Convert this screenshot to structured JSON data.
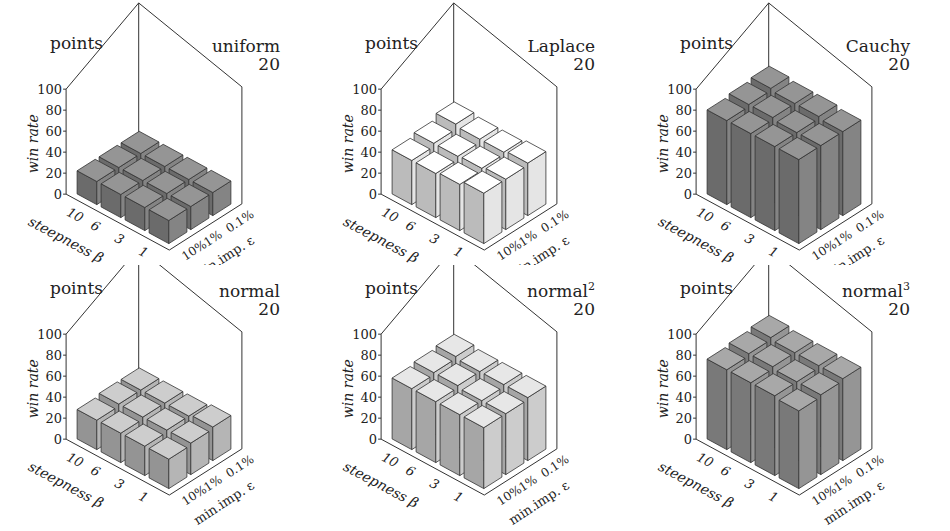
{
  "figure": {
    "grid": [
      2,
      3
    ],
    "common": {
      "corner_label": "points",
      "zlabel": "win rate",
      "xlabel": "steepness β",
      "ylabel": "min.imp. ε",
      "z_ticks": [
        "0",
        "20",
        "40",
        "60",
        "80",
        "100"
      ],
      "x_ticks": [
        "10",
        "6",
        "3",
        "1"
      ],
      "y_ticks": [
        "10%",
        "1%",
        "0.1%"
      ]
    }
  },
  "chart_data": [
    {
      "type": "bar3d",
      "title": "uniform",
      "title_sup": "",
      "subtitle": "20",
      "corner_label": "points",
      "xlabel": "steepness β",
      "ylabel": "min.imp. ε",
      "zlabel": "win rate",
      "x": [
        "10",
        "6",
        "3",
        "1"
      ],
      "y": [
        "10%",
        "1%",
        "0.1%"
      ],
      "zlim": [
        0,
        100
      ],
      "values": [
        [
          22,
          22,
          22
        ],
        [
          22,
          22,
          22
        ],
        [
          22,
          22,
          22
        ],
        [
          22,
          22,
          22
        ]
      ],
      "color": "#7a7a7a"
    },
    {
      "type": "bar3d",
      "title": "Laplace",
      "title_sup": "",
      "subtitle": "20",
      "corner_label": "points",
      "xlabel": "steepness β",
      "ylabel": "min.imp. ε",
      "zlabel": "win rate",
      "x": [
        "10",
        "6",
        "3",
        "1"
      ],
      "y": [
        "10%",
        "1%",
        "0.1%"
      ],
      "zlim": [
        0,
        100
      ],
      "values": [
        [
          42,
          45,
          50
        ],
        [
          42,
          45,
          48
        ],
        [
          44,
          46,
          48
        ],
        [
          48,
          48,
          50
        ]
      ],
      "color": "#d4d4d4"
    },
    {
      "type": "bar3d",
      "title": "Cauchy",
      "title_sup": "",
      "subtitle": "20",
      "corner_label": "points",
      "xlabel": "steepness β",
      "ylabel": "min.imp. ε",
      "zlabel": "win rate",
      "x": [
        "10",
        "6",
        "3",
        "1"
      ],
      "y": [
        "10%",
        "1%",
        "0.1%"
      ],
      "zlim": [
        0,
        100
      ],
      "values": [
        [
          80,
          82,
          84
        ],
        [
          80,
          82,
          82
        ],
        [
          80,
          80,
          82
        ],
        [
          80,
          80,
          80
        ]
      ],
      "color": "#7a7a7a"
    },
    {
      "type": "bar3d",
      "title": "normal",
      "title_sup": "",
      "subtitle": "20",
      "corner_label": "points",
      "xlabel": "steepness β",
      "ylabel": "min.imp. ε",
      "zlabel": "win rate",
      "x": [
        "10",
        "6",
        "3",
        "1"
      ],
      "y": [
        "10%",
        "1%",
        "0.1%"
      ],
      "zlim": [
        0,
        100
      ],
      "values": [
        [
          28,
          30,
          30
        ],
        [
          28,
          30,
          30
        ],
        [
          28,
          30,
          30
        ],
        [
          28,
          30,
          32
        ]
      ],
      "color": "#a8a8a8"
    },
    {
      "type": "bar3d",
      "title": "normal",
      "title_sup": "2",
      "subtitle": "20",
      "corner_label": "points",
      "xlabel": "steepness β",
      "ylabel": "min.imp. ε",
      "zlabel": "win rate",
      "x": [
        "10",
        "6",
        "3",
        "1"
      ],
      "y": [
        "10%",
        "1%",
        "0.1%"
      ],
      "zlim": [
        0,
        100
      ],
      "values": [
        [
          58,
          60,
          62
        ],
        [
          58,
          60,
          60
        ],
        [
          58,
          58,
          60
        ],
        [
          58,
          58,
          60
        ]
      ],
      "color": "#bdbdbd"
    },
    {
      "type": "bar3d",
      "title": "normal",
      "title_sup": "3",
      "subtitle": "20",
      "corner_label": "points",
      "xlabel": "steepness β",
      "ylabel": "min.imp. ε",
      "zlabel": "win rate",
      "x": [
        "10",
        "6",
        "3",
        "1"
      ],
      "y": [
        "10%",
        "1%",
        "0.1%"
      ],
      "zlim": [
        0,
        100
      ],
      "values": [
        [
          76,
          78,
          80
        ],
        [
          76,
          78,
          78
        ],
        [
          76,
          76,
          78
        ],
        [
          74,
          76,
          78
        ]
      ],
      "color": "#8a8a8a"
    }
  ]
}
